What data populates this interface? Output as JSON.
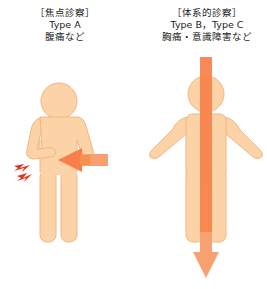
{
  "left": {
    "heading": "［焦点診察］",
    "type": "Type A",
    "example": "腹痛など"
  },
  "right": {
    "heading": "［体系的診察］",
    "type": "Type B，Type C",
    "example": "胸痛・意識障害など"
  },
  "colors": {
    "body_fill": "#fbd3a6",
    "body_stroke": "#f2b682",
    "arrow": "#f7804a",
    "lightning": "#e8321e"
  }
}
